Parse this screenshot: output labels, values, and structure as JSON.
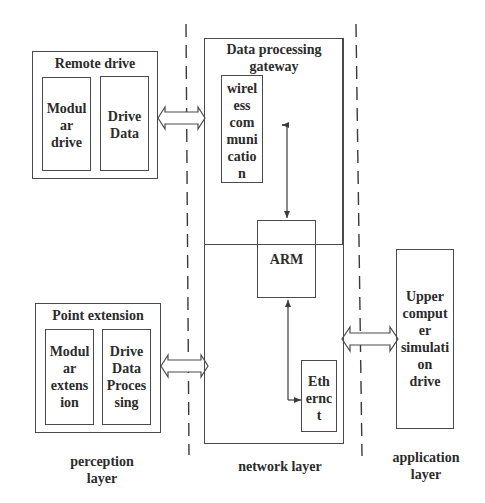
{
  "diagram": {
    "layers": {
      "perception": "perception\nlayer",
      "network": "network layer",
      "application": "application\nlayer"
    },
    "remote_drive": {
      "title": "Remote drive",
      "modular_drive": "Modul\nar\ndrive",
      "drive_data": "Drive\nData"
    },
    "point_extension": {
      "title": "Point extension",
      "modular_extension": "Modul\nar\nextens\nion",
      "drive_data_processing": "Drive\nData\nProces\nsing"
    },
    "gateway": {
      "title": "Data processing\ngateway",
      "wireless": "wirel\ness\ncom\nmuni\ncatio\nn",
      "arm": "ARM",
      "ethernet": "Eth\nernc\nt"
    },
    "upper_computer": {
      "label": "Upper\ncomput\ner\nsimulati\non\ndrive"
    },
    "colors": {
      "line": "#4a4a4a",
      "text": "#2b2b2b",
      "background": "#ffffff"
    }
  }
}
